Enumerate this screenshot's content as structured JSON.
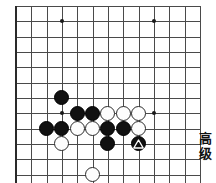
{
  "app": {
    "kind": "go-board-diagram",
    "background": "#ffffff"
  },
  "board": {
    "name": "go-board",
    "columns": 12,
    "rows": 12,
    "origin_x": 16,
    "origin_y": 6,
    "spacing": 15.33,
    "line_color": "#4a4a4a",
    "edge_color": "#2a2a2a",
    "stone_diameter": 15,
    "star_points": [
      {
        "col": 3,
        "row": 1
      },
      {
        "col": 9,
        "row": 1
      },
      {
        "col": 3,
        "row": 7
      },
      {
        "col": 9,
        "row": 7
      }
    ],
    "stones": [
      {
        "color": "black",
        "col": 3,
        "row": 6,
        "marked": false
      },
      {
        "color": "black",
        "col": 4,
        "row": 7,
        "marked": false
      },
      {
        "color": "black",
        "col": 5,
        "row": 7,
        "marked": false
      },
      {
        "color": "white",
        "col": 6,
        "row": 7,
        "marked": false
      },
      {
        "color": "white",
        "col": 7,
        "row": 7,
        "marked": false
      },
      {
        "color": "white",
        "col": 8,
        "row": 7,
        "marked": false
      },
      {
        "color": "black",
        "col": 2,
        "row": 8,
        "marked": false
      },
      {
        "color": "black",
        "col": 3,
        "row": 8,
        "marked": false
      },
      {
        "color": "white",
        "col": 4,
        "row": 8,
        "marked": false
      },
      {
        "color": "white",
        "col": 5,
        "row": 8,
        "marked": false
      },
      {
        "color": "black",
        "col": 6,
        "row": 8,
        "marked": false
      },
      {
        "color": "black",
        "col": 7,
        "row": 8,
        "marked": false
      },
      {
        "color": "white",
        "col": 8,
        "row": 8,
        "marked": false
      },
      {
        "color": "white",
        "col": 3,
        "row": 9,
        "marked": false
      },
      {
        "color": "black",
        "col": 6,
        "row": 9,
        "marked": false
      },
      {
        "color": "black",
        "col": 8,
        "row": 9,
        "marked": true
      },
      {
        "color": "white",
        "col": 5,
        "row": 11,
        "marked": false
      }
    ],
    "marks": [
      {
        "type": "triangle",
        "col": 8,
        "row": 9,
        "stroke": "#ffffff"
      }
    ]
  },
  "side_label": {
    "name": "difficulty-label",
    "text": "高级",
    "characters": [
      "高",
      "级"
    ],
    "color": "#111111"
  }
}
